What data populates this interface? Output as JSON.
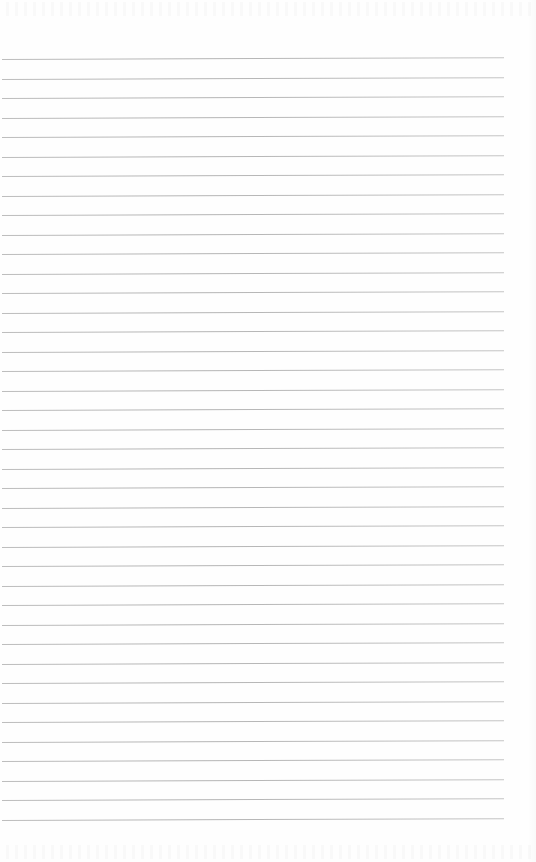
{
  "document": {
    "type": "lined-paper",
    "background_color": "#fefefe",
    "line_color": "#b8b8b8",
    "line_count": 40,
    "first_line_y": 59,
    "line_spacing": 19.5,
    "line_left_x": 2,
    "line_right_x": 504,
    "handwritten_text": ""
  }
}
